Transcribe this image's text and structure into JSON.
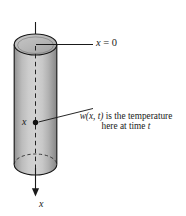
{
  "figure": {
    "kind": "heat-conduction-rod-diagram",
    "background_color": "#ffffff",
    "ink_color": "#1a1a1a",
    "labels": {
      "origin": {
        "variable": "x",
        "equals": " = ",
        "value": "0",
        "full_text": "x = 0"
      },
      "point": {
        "variable": "x"
      },
      "axis": {
        "variable": "x"
      },
      "annotation": {
        "line1_function": "w(x, t)",
        "line1_rest": " is the temperature",
        "line2_prefix": "here at time ",
        "line2_variable": "t",
        "full_text": "w(x, t) is the temperature here at time t"
      }
    },
    "cylinder": {
      "fill_light": "#cfcfcf",
      "fill_mid": "#b4b4b4",
      "fill_dark": "#8d8d8d",
      "top_cap_fill": "#b8b8b8",
      "outline_color": "#1a1a1a",
      "center_line_style": "dashed"
    },
    "axis_arrow": {
      "direction": "down",
      "color": "#1a1a1a"
    }
  }
}
